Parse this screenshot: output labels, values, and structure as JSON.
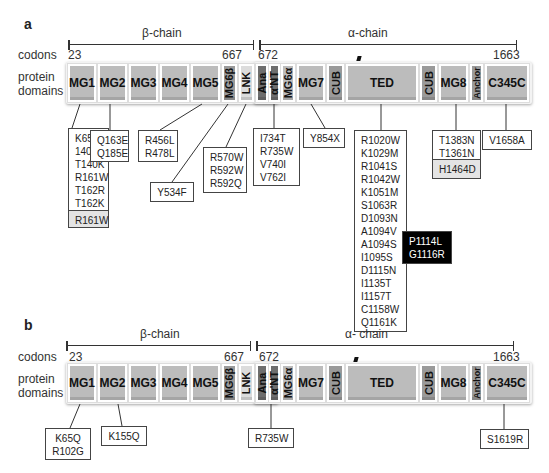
{
  "panels": [
    {
      "label": "a",
      "row_labels": {
        "codons": "codons",
        "domains_line1": "protein",
        "domains_line2": "domains"
      },
      "beta_chain": {
        "label": "β-chain",
        "start": "23",
        "end": "667"
      },
      "alpha_chain": {
        "label": "α-chain",
        "start": "672",
        "end": "1663"
      },
      "domains": [
        "MG1",
        "MG2",
        "MG3",
        "MG4",
        "MG5",
        "MG6β",
        "LNK",
        "Ana",
        "α'NT",
        "MG6α",
        "MG7",
        "CUB",
        "TED",
        "CUB",
        "MG8",
        "Anchor",
        "C345C"
      ],
      "mutation_boxes": {
        "mg1": [
          "K65QT",
          "140R",
          "T140K",
          "R161W",
          "T162R",
          "T162K"
        ],
        "mg1_gray": "R161W",
        "mg2": [
          "Q163E",
          "Q185E"
        ],
        "mg4_mg5": [
          "R456L",
          "R478L"
        ],
        "mg5": [
          "Y534F"
        ],
        "lnk": [
          "R570W",
          "R592W",
          "R592Q"
        ],
        "ant": [
          "I734T",
          "R735W",
          "V740I",
          "V762I"
        ],
        "mg7": [
          "Y854X"
        ],
        "ted": [
          "R1020W",
          "K1029M",
          "R1041S",
          "R1042W",
          "K1051M",
          "S1063R",
          "D1093N",
          "A1094V",
          "A1094S",
          "I1095S",
          "D1115N",
          "I1135T",
          "I1157T",
          "C1158W",
          "Q1161K"
        ],
        "ted_black": [
          "P1114L",
          "G1116R"
        ],
        "mg8": [
          "T1383N",
          "T1361N"
        ],
        "mg8_gray": "H1464D",
        "c345c": [
          "V1658A"
        ]
      }
    },
    {
      "label": "b",
      "row_labels": {
        "codons": "codons",
        "domains_line1": "protein",
        "domains_line2": "domains"
      },
      "beta_chain": {
        "label": "β-chain",
        "start": "23",
        "end": "667"
      },
      "alpha_chain": {
        "label": "α- chain",
        "start": "672",
        "end": "1663"
      },
      "domains": [
        "MG1",
        "MG2",
        "MG3",
        "MG4",
        "MG5",
        "MG6β",
        "LNK",
        "Ana",
        "α'NT",
        "MG6α",
        "MG7",
        "CUB",
        "TED",
        "CUB",
        "MG8",
        "Anchor",
        "C345C"
      ],
      "mutation_boxes": {
        "mg1": [
          "K65Q",
          "R102G"
        ],
        "mg2": [
          "K155Q"
        ],
        "ant": [
          "R735W"
        ],
        "c345c": [
          "S1619R"
        ]
      }
    }
  ]
}
